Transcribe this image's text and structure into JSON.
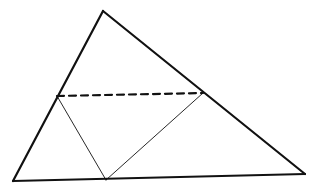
{
  "diagram": {
    "type": "geometry",
    "stroke_color": "#111111",
    "background": "#ffffff",
    "points": {
      "apex": [
        103,
        11
      ],
      "bottom_left": [
        13,
        181
      ],
      "bottom_right": [
        305,
        174
      ],
      "left_mid": [
        57,
        96
      ],
      "right_mid": [
        203,
        93
      ],
      "base_point": [
        106,
        180
      ]
    },
    "segments": [
      {
        "name": "side-left",
        "from": "bottom_left",
        "to": "apex",
        "style": "thick"
      },
      {
        "name": "side-right",
        "from": "apex",
        "to": "bottom_right",
        "style": "thick"
      },
      {
        "name": "base",
        "from": "bottom_left",
        "to": "bottom_right",
        "style": "thick"
      },
      {
        "name": "dashed-midline",
        "from": "left_mid",
        "to": "right_mid",
        "style": "dashed"
      },
      {
        "name": "fold-left",
        "from": "left_mid",
        "to": "base_point",
        "style": "thin"
      },
      {
        "name": "fold-right",
        "from": "right_mid",
        "to": "base_point",
        "style": "thin"
      }
    ]
  }
}
